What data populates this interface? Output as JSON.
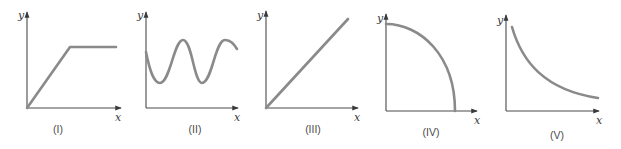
{
  "figure": {
    "curve_color": "#8a8a8a",
    "axis_color": "#4a4a4a",
    "panels": [
      {
        "id": "I",
        "label": "(I)",
        "x_axis_label": "x",
        "y_axis_label": "y",
        "shape": "linear rise then plateau"
      },
      {
        "id": "II",
        "label": "(II)",
        "x_axis_label": "x",
        "y_axis_label": "y",
        "shape": "oscillating sinusoid"
      },
      {
        "id": "III",
        "label": "(III)",
        "x_axis_label": "x",
        "y_axis_label": "y",
        "shape": "straight line through origin"
      },
      {
        "id": "IV",
        "label": "(IV)",
        "x_axis_label": "x",
        "y_axis_label": "y",
        "shape": "concave-down quarter arc falling to x-axis"
      },
      {
        "id": "V",
        "label": "(V)",
        "x_axis_label": "x",
        "y_axis_label": "y",
        "shape": "decreasing decay curve"
      }
    ]
  }
}
